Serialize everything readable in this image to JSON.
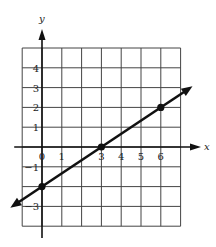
{
  "chart_data": {
    "type": "line",
    "title": "",
    "xlabel": "x",
    "ylabel": "y",
    "xlim": [
      -1,
      7
    ],
    "ylim": [
      -4,
      5
    ],
    "grid": true,
    "x_tick_labels": [
      "0",
      "1",
      "3",
      "4",
      "5",
      "6"
    ],
    "x_ticks": [
      0,
      1,
      3,
      4,
      5,
      6
    ],
    "y_tick_labels": [
      "4",
      "3",
      "2",
      "1",
      "−1",
      "−3"
    ],
    "y_ticks": [
      4,
      3,
      2,
      1,
      -1,
      -3
    ],
    "series": [
      {
        "name": "line",
        "equation": "y = (2/3)x - 2",
        "slope": 0.6667,
        "intercept": -2,
        "points": [
          [
            0,
            -2
          ],
          [
            3,
            0
          ],
          [
            6,
            2
          ]
        ],
        "arrows_both_ends": true
      }
    ],
    "colors": {
      "line": "#111111",
      "grid": "#333333"
    }
  }
}
